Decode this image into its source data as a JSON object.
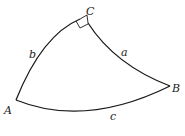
{
  "figure": {
    "type": "spherical-right-triangle",
    "vertices": [
      {
        "name": "A",
        "x": 16,
        "y": 100,
        "label_x": 4,
        "label_y": 114
      },
      {
        "name": "B",
        "x": 170,
        "y": 86,
        "label_x": 172,
        "label_y": 92
      },
      {
        "name": "C",
        "x": 87,
        "y": 15,
        "label_x": 86,
        "label_y": 15
      }
    ],
    "sides": [
      {
        "name": "a",
        "label_x": 121,
        "label_y": 56
      },
      {
        "name": "b",
        "label_x": 29,
        "label_y": 58
      },
      {
        "name": "c",
        "label_x": 110,
        "label_y": 120
      }
    ],
    "right_angle_at": "C",
    "stroke_color": "#1a1a1a"
  }
}
